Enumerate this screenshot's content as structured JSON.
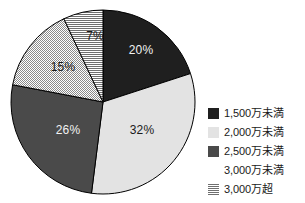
{
  "chart_data": {
    "type": "pie",
    "title": "",
    "categories": [
      "1,500万未満",
      "2,000万未満",
      "2,500万未満",
      "3,000万未満",
      "3,000万超"
    ],
    "values": [
      20,
      32,
      26,
      15,
      7
    ],
    "value_labels": [
      "20%",
      "32%",
      "26%",
      "15%",
      "7%"
    ],
    "unit": "%",
    "start_angle_deg": 0,
    "direction": "clockwise",
    "legend_position": "right",
    "grid": false,
    "slice_styles": [
      "solid-darkest",
      "solid-light",
      "solid-mid",
      "dots",
      "horizontal-stripes"
    ],
    "slice_colors": [
      "#1f1f1f",
      "#e3e3e3",
      "#4a4a4a",
      "#ffffff",
      "#ffffff"
    ],
    "label_colors": [
      "#f2f2f2",
      "#1a1a1a",
      "#f2f2f2",
      "#1a1a1a",
      "#1a1a1a"
    ],
    "pattern_ink": "#6f6f6f",
    "outline_color": "#000000",
    "background": "#ffffff"
  },
  "pie": {
    "slices": [
      {
        "label": "20%",
        "value": 20,
        "legend": "1,500万未満"
      },
      {
        "label": "32%",
        "value": 32,
        "legend": "2,000万未満"
      },
      {
        "label": "26%",
        "value": 26,
        "legend": "2,500万未満"
      },
      {
        "label": "15%",
        "value": 15,
        "legend": "3,000万未満"
      },
      {
        "label": "7%",
        "value": 7,
        "legend": "3,000万超"
      }
    ]
  },
  "legend": {
    "items": [
      {
        "label": "1,500万未満",
        "swatch": "solid-darkest"
      },
      {
        "label": "2,000万未満",
        "swatch": "solid-light"
      },
      {
        "label": "2,500万未満",
        "swatch": "solid-mid"
      },
      {
        "label": "3,000万未満",
        "swatch": "dots"
      },
      {
        "label": "3,000万超",
        "swatch": "horizontal-stripes"
      }
    ]
  }
}
